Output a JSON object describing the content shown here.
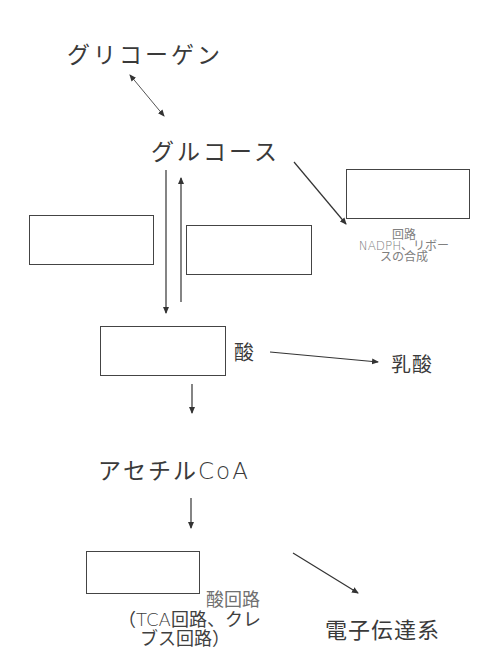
{
  "diagram": {
    "nodes": {
      "glycogen": "グリコーゲン",
      "glucose": "グルコース",
      "pyruvate_suffix": "酸",
      "lactate": "乳酸",
      "acetyl_coa": "アセチルCoA",
      "electron_transport": "電子伝達系",
      "pentose_line1": "回路",
      "pentose_line2": "NADPH、リボー",
      "pentose_line3": "スの合成",
      "tca_line1": "酸回路",
      "tca_line2": "（TCA回路、クレ",
      "tca_line3": "ブス回路）"
    },
    "blank_boxes": [
      {
        "id": "pentose-phosphate-blank",
        "x": 346,
        "y": 169,
        "w": 124,
        "h": 50
      },
      {
        "id": "glycolysis-blank",
        "x": 29,
        "y": 215,
        "w": 125,
        "h": 50
      },
      {
        "id": "gluconeogenesis-blank",
        "x": 186,
        "y": 225,
        "w": 126,
        "h": 50
      },
      {
        "id": "pyruvate-blank",
        "x": 100,
        "y": 326,
        "w": 126,
        "h": 50
      },
      {
        "id": "citric-acid-blank",
        "x": 86,
        "y": 551,
        "w": 114,
        "h": 43
      }
    ],
    "colors": {
      "line": "#333333",
      "text": "#3a3a3a",
      "faded_text": "#808080"
    }
  }
}
